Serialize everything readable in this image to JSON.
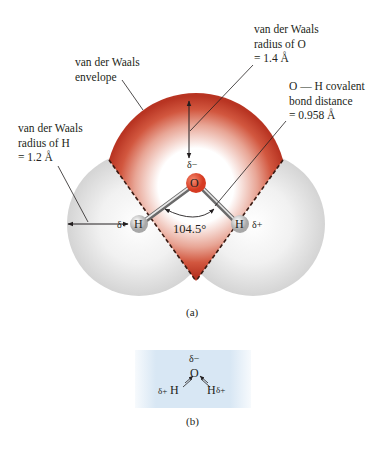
{
  "figure_a": {
    "caption": "(a)",
    "labels": {
      "envelope": [
        "van der Waals",
        "envelope"
      ],
      "radius_o": [
        "van der Waals",
        "radius of O",
        "= 1.4 Å"
      ],
      "bond": [
        "O — H covalent",
        "bond distance",
        "= 0.958 Å"
      ],
      "radius_h": [
        "van der Waals",
        "radius of H",
        "= 1.2 Å"
      ]
    },
    "atoms": {
      "oxygen": "O",
      "hydrogen_left": "H",
      "hydrogen_right": "H"
    },
    "charges": {
      "oxygen": "δ−",
      "hydrogen_left": "δ+",
      "hydrogen_right": "δ+"
    },
    "angle": "104.5°",
    "colors": {
      "oxygen_envelope": "#c0392b",
      "hydrogen_envelope": "#d9d9d9",
      "oxygen_atom": "#e04a2f"
    }
  },
  "figure_b": {
    "caption": "(b)",
    "oxygen": "O",
    "oxygen_charge": "δ−",
    "hydrogen_left": "H",
    "hydrogen_left_charge": "δ+",
    "hydrogen_right": "H",
    "hydrogen_right_charge": "δ+",
    "background": "#d8e7f4"
  }
}
